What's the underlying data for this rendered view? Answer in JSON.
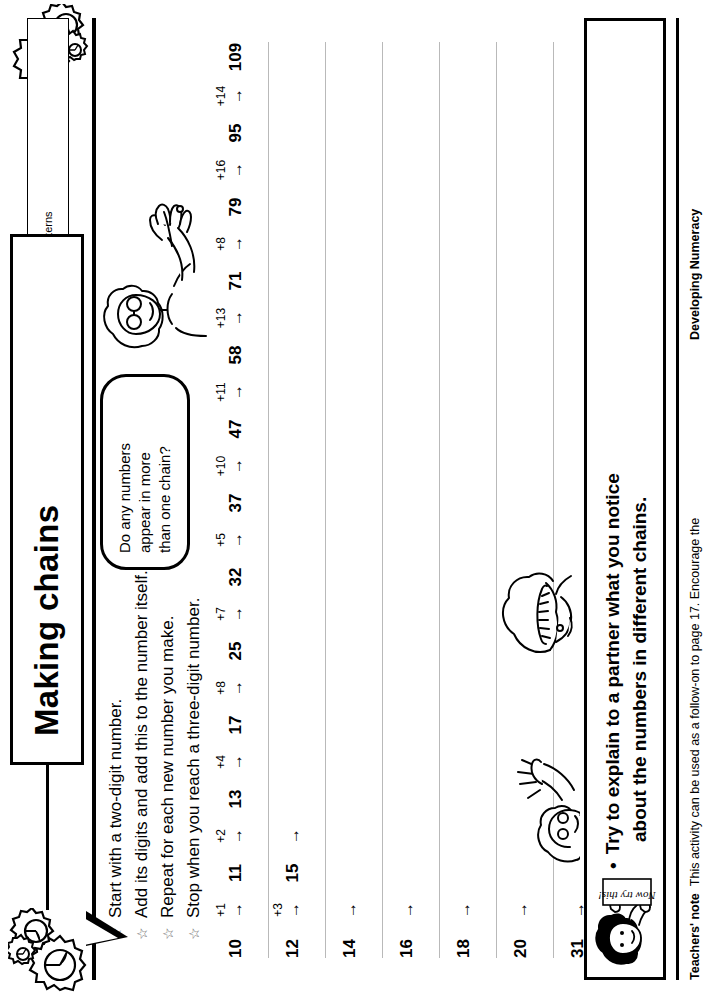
{
  "page": {
    "title": "Making chains",
    "subtitle": "Look for patterns"
  },
  "instructions": {
    "bullet_glyph": "☆",
    "items": [
      "Start with a two-digit number.",
      "Add its digits and add this to the number itself.",
      "Repeat for each new number you make.",
      "Stop when you reach a three-digit number."
    ]
  },
  "speech_bubble": {
    "line1": "Do any numbers",
    "line2": "appear in more",
    "line3": "than one chain?"
  },
  "chains": {
    "arrow_glyph": "→",
    "rows": [
      {
        "start": "10",
        "steps": [
          {
            "op": "+1",
            "node": "11"
          },
          {
            "op": "+2",
            "node": "13"
          },
          {
            "op": "+4",
            "node": "17"
          },
          {
            "op": "+8",
            "node": "25"
          },
          {
            "op": "+7",
            "node": "32"
          },
          {
            "op": "+5",
            "node": "37"
          },
          {
            "op": "+10",
            "node": "47"
          },
          {
            "op": "+11",
            "node": "58"
          },
          {
            "op": "+13",
            "node": "71"
          },
          {
            "op": "+8",
            "node": "79"
          },
          {
            "op": "+16",
            "node": "95"
          },
          {
            "op": "+14",
            "node": "109"
          }
        ]
      },
      {
        "start": "12",
        "steps": [
          {
            "op": "+3",
            "node": "15"
          },
          {
            "op": "",
            "node": ""
          }
        ]
      },
      {
        "start": "14",
        "steps": [
          {
            "op": "",
            "node": ""
          }
        ]
      },
      {
        "start": "16",
        "steps": [
          {
            "op": "",
            "node": ""
          }
        ]
      },
      {
        "start": "18",
        "steps": [
          {
            "op": "",
            "node": ""
          }
        ]
      },
      {
        "start": "20",
        "steps": [
          {
            "op": "",
            "node": ""
          }
        ]
      },
      {
        "start": "31",
        "steps": [
          {
            "op": "",
            "node": ""
          }
        ]
      }
    ]
  },
  "discussion": {
    "bullet_glyph": "•",
    "text": "Talk to a partner about any patterns you notice."
  },
  "now_try_this": {
    "bullet_glyph": "•",
    "sign_label": "Now try this!",
    "line1": "Try to explain to a partner what you notice",
    "line2": "about the numbers in different chains."
  },
  "footer": {
    "note_label": "Teachers' note",
    "note_text": "This activity can be used as a follow-on to page 17. Encourage the",
    "series": "Developing Numeracy"
  }
}
